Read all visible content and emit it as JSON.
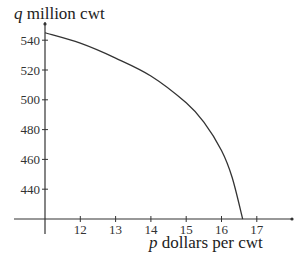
{
  "chart_data": {
    "type": "line",
    "title": "",
    "xlabel": "p dollars per cwt",
    "ylabel": "q million cwt",
    "xlabel_var": "p",
    "xlabel_rest": " dollars per cwt",
    "ylabel_var": "q",
    "ylabel_rest": " million cwt",
    "x_ticks": [
      12,
      13,
      14,
      15,
      16,
      17
    ],
    "y_ticks": [
      440,
      460,
      480,
      500,
      520,
      540
    ],
    "xlim": [
      11,
      18
    ],
    "ylim": [
      420,
      550
    ],
    "grid": false,
    "legend": null,
    "series": [
      {
        "name": "demand curve",
        "x": [
          11,
          12,
          13,
          14,
          15,
          15.5,
          16,
          16.3,
          16.6
        ],
        "y": [
          545,
          538,
          528,
          516,
          498,
          485,
          466,
          448,
          420
        ]
      }
    ],
    "colors": {
      "axis": "#333333",
      "curve": "#333333",
      "background": "#ffffff"
    }
  }
}
